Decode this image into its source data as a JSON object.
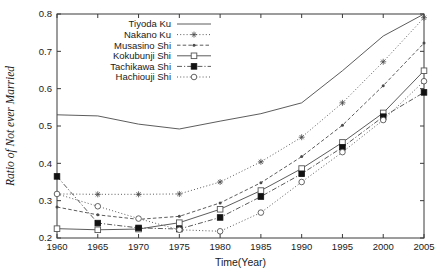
{
  "chart_data": {
    "type": "line",
    "title": "",
    "xlabel": "Time(Year)",
    "ylabel": "Ratio of Not ever Married",
    "x": [
      1960,
      1965,
      1970,
      1975,
      1980,
      1985,
      1990,
      1995,
      2000,
      2005
    ],
    "xlim": [
      1960,
      2005
    ],
    "ylim": [
      0.2,
      0.8
    ],
    "xticks": [
      "1960",
      "1965",
      "1970",
      "1975",
      "1980",
      "1985",
      "1990",
      "1995",
      "2000",
      "2005"
    ],
    "yticks": [
      "0.2",
      "0.3",
      "0.4",
      "0.5",
      "0.6",
      "0.7",
      "0.8"
    ],
    "grid": false,
    "legend_position": "top-left",
    "series": [
      {
        "name": "Tiyoda Ku",
        "marker": "none",
        "dash": "solid",
        "values": [
          0.53,
          0.527,
          0.505,
          0.492,
          0.513,
          0.533,
          0.562,
          0.648,
          0.741,
          0.8
        ]
      },
      {
        "name": "Nakano Ku",
        "marker": "star",
        "dash": "dotted",
        "values": [
          0.318,
          0.317,
          0.317,
          0.318,
          0.35,
          0.404,
          0.47,
          0.562,
          0.672,
          0.79
        ]
      },
      {
        "name": "Musasino Shi",
        "marker": "dot",
        "dash": "dashed",
        "values": [
          0.283,
          0.262,
          0.25,
          0.258,
          0.294,
          0.348,
          0.418,
          0.502,
          0.608,
          0.722
        ]
      },
      {
        "name": "Kokubunji Shi",
        "marker": "open-square",
        "dash": "solid",
        "values": [
          0.225,
          0.222,
          0.224,
          0.241,
          0.277,
          0.327,
          0.386,
          0.456,
          0.535,
          0.648
        ]
      },
      {
        "name": "Tachikawa Shi",
        "marker": "filled-square",
        "dash": "dash-dot",
        "values": [
          0.365,
          0.24,
          0.227,
          0.224,
          0.255,
          0.311,
          0.372,
          0.443,
          0.525,
          0.59
        ]
      },
      {
        "name": "Hachiouji Shi",
        "marker": "open-circle",
        "dash": "dotted",
        "values": [
          0.318,
          0.285,
          0.252,
          0.222,
          0.218,
          0.268,
          0.35,
          0.43,
          0.516,
          0.62
        ]
      }
    ]
  }
}
